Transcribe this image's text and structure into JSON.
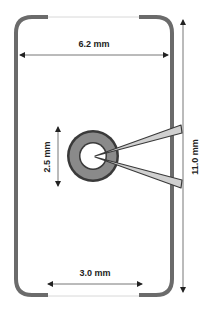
{
  "diagram": {
    "type": "technical-dimension-drawing",
    "colors": {
      "outline": "#6b6b6b",
      "outline_light": "#d8d8d8",
      "ring_fill": "#8a8a8a",
      "ring_edge": "#3a3a3a",
      "wedge_fill": "#d0d0d0",
      "wedge_edge": "#3a3a3a",
      "dim_line": "#777777",
      "text": "#222222"
    },
    "dimensions": {
      "top_width": "6.2 mm",
      "bottom_opening": "3.0 mm",
      "height": "11.0 mm",
      "ring_diameter": "2.5 mm"
    }
  }
}
